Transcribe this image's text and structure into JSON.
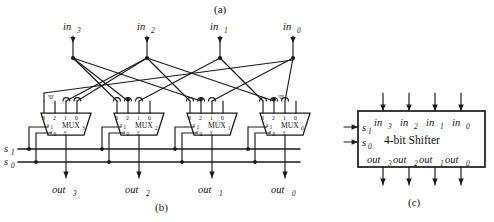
{
  "figure": {
    "panels": [
      {
        "id": "a",
        "label": "(a)"
      },
      {
        "id": "b",
        "label": "(b)"
      },
      {
        "id": "c",
        "label": "(c)"
      }
    ],
    "colors": {
      "ink": "#1a1a1a",
      "background": "#ffffff"
    }
  },
  "panel_b": {
    "inputs": [
      {
        "name": "in3",
        "base": "in",
        "sub": "3"
      },
      {
        "name": "in2",
        "base": "in",
        "sub": "2"
      },
      {
        "name": "in1",
        "base": "in",
        "sub": "1"
      },
      {
        "name": "in0",
        "base": "in",
        "sub": "0"
      }
    ],
    "outputs": [
      {
        "name": "out3",
        "base": "out",
        "sub": "3"
      },
      {
        "name": "out2",
        "base": "out",
        "sub": "2"
      },
      {
        "name": "out1",
        "base": "out",
        "sub": "1"
      },
      {
        "name": "out0",
        "base": "out",
        "sub": "0"
      }
    ],
    "selects": [
      {
        "name": "s1",
        "base": "s",
        "sub": "1"
      },
      {
        "name": "s0",
        "base": "s",
        "sub": "0"
      }
    ],
    "muxes": [
      {
        "name": "MUX3",
        "base": "MUX",
        "sub": "3",
        "pins": [
          "3",
          "2",
          "1",
          "0"
        ],
        "sel_pins": [
          "s1",
          "s0"
        ],
        "sel_base": "s",
        "out_pin": "y",
        "sources": [
          "'0'",
          "'0'",
          "in3",
          "in2"
        ]
      },
      {
        "name": "MUX2",
        "base": "MUX",
        "sub": "2",
        "pins": [
          "3",
          "2",
          "1",
          "0"
        ],
        "sel_pins": [
          "s1",
          "s0"
        ],
        "sel_base": "s",
        "out_pin": "y",
        "sources": [
          "in3",
          "in3",
          "in2",
          "in1"
        ]
      },
      {
        "name": "MUX1",
        "base": "MUX",
        "sub": "1",
        "pins": [
          "3",
          "2",
          "1",
          "0"
        ],
        "sel_pins": [
          "s1",
          "s0"
        ],
        "sel_base": "s",
        "out_pin": "y",
        "sources": [
          "in2",
          "in3",
          "in1",
          "in0"
        ]
      },
      {
        "name": "MUX0",
        "base": "MUX",
        "sub": "0",
        "pins": [
          "3",
          "2",
          "1",
          "0"
        ],
        "sel_pins": [
          "s1",
          "s0"
        ],
        "sel_base": "s",
        "out_pin": "y",
        "sources": [
          "in1",
          "in2",
          "'0'",
          "in0"
        ]
      }
    ],
    "constants": [
      {
        "label": "'0'",
        "at": "mux3-pin2"
      },
      {
        "label": "'0'",
        "at": "mux0-pin1"
      }
    ]
  },
  "panel_c": {
    "title": "4-bit Shifter",
    "inputs": [
      {
        "name": "in3",
        "base": "in",
        "sub": "3"
      },
      {
        "name": "in2",
        "base": "in",
        "sub": "2"
      },
      {
        "name": "in1",
        "base": "in",
        "sub": "1"
      },
      {
        "name": "in0",
        "base": "in",
        "sub": "0"
      }
    ],
    "outputs": [
      {
        "name": "out3",
        "base": "out",
        "sub": "3"
      },
      {
        "name": "out2",
        "base": "out",
        "sub": "2"
      },
      {
        "name": "out1",
        "base": "out",
        "sub": "1"
      },
      {
        "name": "out0",
        "base": "out",
        "sub": "0"
      }
    ],
    "selects": [
      {
        "name": "s1",
        "base": "s",
        "sub": "1"
      },
      {
        "name": "s0",
        "base": "s",
        "sub": "0"
      }
    ]
  }
}
